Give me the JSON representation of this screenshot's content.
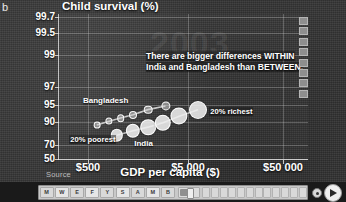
{
  "panel": {
    "letter": "b"
  },
  "chart_data": {
    "type": "scatter",
    "title": "",
    "ylabel": "Child survival (%)",
    "xlabel": "GDP per capita ($)",
    "year_watermark": "2003",
    "annotation": [
      "There are bigger differences WITHIN",
      "India and Bangladesh than BETWEEN."
    ],
    "xscale": "log",
    "yscale": "log-survival",
    "xticks": [
      {
        "label": "$500",
        "pos": 0.12
      },
      {
        "label": "$5 000",
        "pos": 0.52
      },
      {
        "label": "$50 000",
        "pos": 0.9
      }
    ],
    "yticks": [
      {
        "label": "99.7",
        "pos": 0.02
      },
      {
        "label": "99.5",
        "pos": 0.13
      },
      {
        "label": "99",
        "pos": 0.28
      },
      {
        "label": "97",
        "pos": 0.5
      },
      {
        "label": "95",
        "pos": 0.62
      },
      {
        "label": "90",
        "pos": 0.74
      },
      {
        "label": "70",
        "pos": 0.9
      },
      {
        "label": "50",
        "pos": 0.99
      }
    ],
    "grid": true,
    "legend_position": "right",
    "series": [
      {
        "name": "Bangladesh",
        "label_x": 0.1,
        "label_y": 0.565,
        "points": [
          {
            "x": 0.155,
            "y": 0.76,
            "r": 2.4,
            "quintile": "20% poorest"
          },
          {
            "x": 0.205,
            "y": 0.735,
            "r": 2.6
          },
          {
            "x": 0.25,
            "y": 0.712,
            "r": 2.8
          },
          {
            "x": 0.3,
            "y": 0.69,
            "r": 3.0
          },
          {
            "x": 0.36,
            "y": 0.655,
            "r": 3.3
          },
          {
            "x": 0.43,
            "y": 0.63,
            "r": 3.6,
            "quintile": "20% richest"
          }
        ]
      },
      {
        "name": "India",
        "label_x": 0.305,
        "label_y": 0.855,
        "points": [
          {
            "x": 0.235,
            "y": 0.83,
            "r": 5.2,
            "quintile": "20% poorest"
          },
          {
            "x": 0.3,
            "y": 0.8,
            "r": 6.2
          },
          {
            "x": 0.36,
            "y": 0.775,
            "r": 6.8
          },
          {
            "x": 0.42,
            "y": 0.745,
            "r": 7.2
          },
          {
            "x": 0.485,
            "y": 0.7,
            "r": 7.6
          },
          {
            "x": 0.56,
            "y": 0.655,
            "r": 8.0,
            "quintile": "20% richest"
          }
        ]
      }
    ],
    "quintile_labels": [
      {
        "text": "20% poorest",
        "x": 0.045,
        "y": 0.83
      },
      {
        "text": "20% richest",
        "x": 0.605,
        "y": 0.64
      }
    ],
    "legend_swatches": 8
  },
  "source": {
    "label": "Source"
  },
  "controls": {
    "year_cells": [
      "M",
      "W",
      "E",
      "F",
      "Y",
      "S",
      "A",
      "M",
      "B"
    ],
    "highlight_cell": "B",
    "tick_cells": 12,
    "progress_percent": 43,
    "speed_dial_name": "speed-dial",
    "play_label": "Play"
  }
}
